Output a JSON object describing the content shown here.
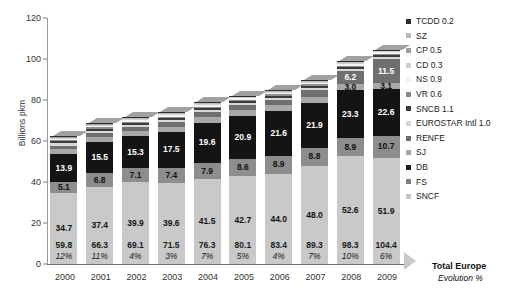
{
  "chart_data": {
    "type": "bar",
    "title": "",
    "subtitle": "",
    "xlabel": "",
    "ylabel": "Billions pkm",
    "ylim": [
      0,
      120
    ],
    "yticks": [
      0,
      20,
      40,
      60,
      80,
      100,
      120
    ],
    "grid": false,
    "stacked": true,
    "legend_position": "right",
    "categories": [
      "2000",
      "2001",
      "2002",
      "2003",
      "2004",
      "2005",
      "2006",
      "2007",
      "2008",
      "2009"
    ],
    "series": [
      {
        "name": "SNCF",
        "values": [
          34.7,
          37.4,
          39.9,
          39.6,
          41.5,
          42.7,
          44.0,
          48.0,
          52.6,
          51.9
        ]
      },
      {
        "name": "FS",
        "values": [
          5.1,
          6.8,
          7.1,
          7.4,
          7.9,
          8.6,
          8.9,
          8.8,
          8.9,
          10.7
        ]
      },
      {
        "name": "DB",
        "values": [
          13.9,
          15.5,
          15.3,
          17.5,
          19.6,
          20.9,
          21.6,
          21.9,
          23.3,
          22.6
        ]
      },
      {
        "name": "SJ",
        "values": [
          2.2,
          2.3,
          2.4,
          2.5,
          2.7,
          2.8,
          2.9,
          3.0,
          3.0,
          3.1
        ]
      },
      {
        "name": "RENFE",
        "values": [
          1.9,
          2.0,
          2.1,
          2.2,
          2.3,
          2.4,
          2.6,
          3.2,
          6.2,
          11.5
        ]
      },
      {
        "name": "EUROSTAR Intl 1.0",
        "values": [
          1.0,
          1.0,
          1.0,
          1.0,
          1.0,
          1.0,
          1.0,
          1.0,
          1.0,
          1.0
        ]
      },
      {
        "name": "SNCB 1.1",
        "values": [
          1.1,
          1.1,
          1.1,
          1.1,
          1.1,
          1.1,
          1.1,
          1.1,
          1.1,
          1.1
        ]
      },
      {
        "name": "VR 0.6",
        "values": [
          0.6,
          0.6,
          0.6,
          0.6,
          0.6,
          0.6,
          0.6,
          0.6,
          0.6,
          0.6
        ]
      },
      {
        "name": "NS 0.9",
        "values": [
          0.9,
          0.9,
          0.9,
          0.9,
          0.9,
          0.9,
          0.9,
          0.9,
          0.9,
          0.9
        ]
      },
      {
        "name": "CD 0.3",
        "values": [
          0.3,
          0.3,
          0.3,
          0.3,
          0.3,
          0.3,
          0.3,
          0.3,
          0.3,
          0.3
        ]
      },
      {
        "name": "CP 0.5",
        "values": [
          0.5,
          0.5,
          0.5,
          0.5,
          0.5,
          0.5,
          0.5,
          0.5,
          0.5,
          0.5
        ]
      },
      {
        "name": "SZ",
        "values": [
          0.2,
          0.2,
          0.2,
          0.2,
          0.2,
          0.2,
          0.2,
          0.2,
          0.2,
          0.2
        ]
      },
      {
        "name": "TCDD 0.2",
        "values": [
          0.2,
          0.2,
          0.2,
          0.2,
          0.2,
          0.2,
          0.2,
          0.2,
          0.2,
          0.2
        ]
      }
    ],
    "totals": [
      "59.8",
      "66.3",
      "69.1",
      "71.5",
      "76.3",
      "80.1",
      "83.4",
      "89.3",
      "98.3",
      "104.4"
    ],
    "evolution": [
      "12%",
      "11%",
      "4%",
      "3%",
      "7%",
      "5%",
      "4%",
      "7%",
      "10%",
      "6%"
    ],
    "bar_labels": {
      "sncf": [
        "34.7",
        "37.4",
        "39.9",
        "39.6",
        "41.5",
        "42.7",
        "44.0",
        "48.0",
        "52.6",
        "51.9"
      ],
      "fs": [
        "5.1",
        "6.8",
        "7.1",
        "7.4",
        "7.9",
        "8.6",
        "8.9",
        "8.8",
        "8.9",
        "10.7"
      ],
      "db": [
        "13.9",
        "15.5",
        "15.3",
        "17.5",
        "19.6",
        "20.9",
        "21.6",
        "21.9",
        "23.3",
        "22.6"
      ],
      "sj": [
        "",
        "",
        "",
        "",
        "",
        "",
        "",
        "",
        "3.0",
        "3.1"
      ],
      "renfe": [
        "",
        "",
        "",
        "",
        "",
        "",
        "",
        "",
        "6.2",
        "11.5"
      ]
    }
  },
  "axis": {
    "y_title": "Billions pkm",
    "y_ticks": [
      "120",
      "100",
      "80",
      "60",
      "40",
      "20",
      "0"
    ],
    "x_ticks": [
      "2000",
      "2001",
      "2002",
      "2003",
      "2004",
      "2005",
      "2006",
      "2007",
      "2008",
      "2009"
    ]
  },
  "totals_caption": {
    "line1": "Total Europe",
    "line2": "Evolution  %"
  },
  "legend": {
    "items": [
      {
        "label": "TCDD 0.2",
        "color": "#2b2b2b"
      },
      {
        "label": "SZ",
        "color": "#b9b9b9"
      },
      {
        "label": "CP 0.5",
        "color": "#9c9c9c"
      },
      {
        "label": "CD 0.3",
        "color": "#cfcfcf"
      },
      {
        "label": "NS 0.9",
        "color": "#f2f2f2"
      },
      {
        "label": "VR 0.6",
        "color": "#8a8a8a"
      },
      {
        "label": "SNCB 1.1",
        "color": "#3a3a3a"
      },
      {
        "label": "EUROSTAR Intl 1.0",
        "color": "#d6d6d6"
      },
      {
        "label": "RENFE",
        "color": "#6d6d6d"
      },
      {
        "label": "SJ",
        "color": "#a5a5a5"
      },
      {
        "label": "DB",
        "color": "#1c1c1c"
      },
      {
        "label": "FS",
        "color": "#7e7e7e"
      },
      {
        "label": "SNCF",
        "color": "#c6c6c6"
      }
    ]
  },
  "colors": {
    "sncf": "#c9c9c9",
    "fs": "#8d8d8d",
    "db": "#141414",
    "sj": "#a8a8a8",
    "renfe": "#6f6f6f",
    "eurostar": "#d8d8d8",
    "sncb": "#3c3c3c",
    "vr": "#8e8e8e",
    "ns": "#f4f4f4",
    "cd": "#d2d2d2",
    "cp": "#9e9e9e",
    "sz": "#bcbcbc",
    "tcdd": "#2e2e2e",
    "axis": "#6e6e6e",
    "text": "#1a1a1a"
  }
}
